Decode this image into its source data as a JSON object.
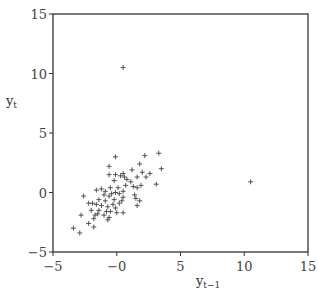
{
  "chart_data": {
    "type": "scatter",
    "title": "",
    "xlabel": "y_{t-1}",
    "ylabel": "y_t",
    "xlim": [
      -5,
      15
    ],
    "ylim": [
      -5,
      15
    ],
    "xticks": [
      -5,
      0,
      5,
      10,
      15
    ],
    "yticks": [
      -5,
      0,
      5,
      10,
      15
    ],
    "xtick_labels": [
      "−5",
      "−0",
      "5",
      "10",
      "15"
    ],
    "ytick_labels": [
      "−5",
      "0",
      "5",
      "10",
      "15"
    ],
    "grid": false,
    "marker": "+",
    "points": [
      [
        0.5,
        10.5
      ],
      [
        10.5,
        0.9
      ],
      [
        3.3,
        3.3
      ],
      [
        2.2,
        3.1
      ],
      [
        -0.1,
        3.0
      ],
      [
        3.5,
        2.0
      ],
      [
        1.8,
        2.4
      ],
      [
        -0.6,
        2.2
      ],
      [
        2.6,
        1.6
      ],
      [
        2.0,
        1.7
      ],
      [
        1.2,
        1.9
      ],
      [
        0.5,
        1.6
      ],
      [
        -0.1,
        1.5
      ],
      [
        -0.6,
        1.5
      ],
      [
        0.3,
        1.4
      ],
      [
        0.6,
        1.3
      ],
      [
        1.6,
        1.3
      ],
      [
        2.3,
        1.3
      ],
      [
        0.8,
        1.1
      ],
      [
        -0.2,
        1.0
      ],
      [
        1.1,
        0.9
      ],
      [
        3.1,
        0.7
      ],
      [
        1.9,
        0.6
      ],
      [
        0.7,
        0.6
      ],
      [
        1.3,
        0.5
      ],
      [
        -0.5,
        0.4
      ],
      [
        0.1,
        0.4
      ],
      [
        1.6,
        0.4
      ],
      [
        -1.2,
        0.3
      ],
      [
        -1.6,
        0.2
      ],
      [
        -0.9,
        0.1
      ],
      [
        0.5,
        0.1
      ],
      [
        -0.1,
        0.0
      ],
      [
        -0.4,
        -0.1
      ],
      [
        0.2,
        -0.1
      ],
      [
        1.4,
        -0.2
      ],
      [
        -1.0,
        -0.2
      ],
      [
        -2.6,
        -0.3
      ],
      [
        -0.6,
        -0.3
      ],
      [
        0.5,
        -0.4
      ],
      [
        1.5,
        -0.5
      ],
      [
        -1.4,
        -0.6
      ],
      [
        -0.2,
        -0.6
      ],
      [
        -0.9,
        -0.7
      ],
      [
        0.4,
        -0.7
      ],
      [
        1.8,
        -0.7
      ],
      [
        -2.2,
        -0.9
      ],
      [
        -1.9,
        -0.9
      ],
      [
        -1.6,
        -1.0
      ],
      [
        -0.3,
        -1.0
      ],
      [
        0.2,
        -0.9
      ],
      [
        -1.2,
        -1.1
      ],
      [
        1.6,
        -1.1
      ],
      [
        -0.7,
        -1.2
      ],
      [
        -0.1,
        -1.3
      ],
      [
        -2.0,
        -1.5
      ],
      [
        -1.4,
        -1.5
      ],
      [
        -0.8,
        -1.6
      ],
      [
        0.0,
        -1.7
      ],
      [
        0.5,
        -1.7
      ],
      [
        -0.5,
        -1.6
      ],
      [
        -2.8,
        -1.9
      ],
      [
        -1.7,
        -1.9
      ],
      [
        -1.0,
        -1.9
      ],
      [
        -0.6,
        -2.1
      ],
      [
        -1.8,
        -2.2
      ],
      [
        -0.7,
        -2.3
      ],
      [
        -2.2,
        -2.6
      ],
      [
        -3.4,
        -3.0
      ],
      [
        -1.8,
        -2.9
      ],
      [
        -2.9,
        -3.4
      ],
      [
        -1.5,
        -1.8
      ]
    ]
  }
}
